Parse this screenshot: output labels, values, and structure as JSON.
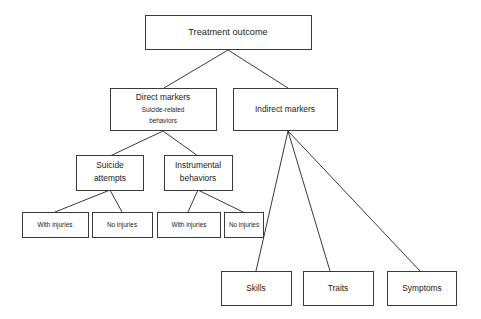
{
  "diagram": {
    "title_node": "Treatment outcome",
    "nodes": [
      {
        "id": "treatment-outcome",
        "label": "Treatment outcome",
        "sublabel1": "",
        "sublabel2": ""
      },
      {
        "id": "direct-markers",
        "label": "Direct markers",
        "sublabel1": "Suicide-related",
        "sublabel2": "behaviors"
      },
      {
        "id": "indirect-markers",
        "label": "Indirect markers",
        "sublabel1": "",
        "sublabel2": ""
      },
      {
        "id": "suicide-attempts",
        "label_line1": "Suicide",
        "label_line2": "attempts"
      },
      {
        "id": "instrumental-behaviors",
        "label_line1": "Instrumental",
        "label_line2": "behaviors"
      },
      {
        "id": "suicide-with-injuries",
        "label": "With injuries"
      },
      {
        "id": "suicide-no-injuries",
        "label": "No injuries"
      },
      {
        "id": "instrumental-with-injuries",
        "label": "With injuries"
      },
      {
        "id": "instrumental-no-injuries",
        "label": "No injuries"
      },
      {
        "id": "skills",
        "label": "Skills"
      },
      {
        "id": "traits",
        "label": "Traits"
      },
      {
        "id": "symptoms",
        "label": "Symptoms"
      }
    ],
    "colors": {
      "background": "#ffffff",
      "box_stroke": "#3a3a3a",
      "box_fill": "#ffffff",
      "text": "#1c1c1c",
      "line": "#3a3a3a"
    }
  },
  "labels": {
    "treatment_outcome": "Treatment outcome",
    "direct_markers": "Direct markers",
    "direct_markers_sub1": "Suicide-related",
    "direct_markers_sub2": "behaviors",
    "indirect_markers": "Indirect markers",
    "suicide_attempts_1": "Suicide",
    "suicide_attempts_2": "attempts",
    "instrumental_behaviors_1": "Instrumental",
    "instrumental_behaviors_2": "behaviors",
    "with_injuries_a": "With injuries",
    "no_injuries_a": "No injuries",
    "with_injuries_b": "With injuries",
    "no_injuries_b": "No injuries",
    "skills": "Skills",
    "traits": "Traits",
    "symptoms": "Symptoms"
  }
}
